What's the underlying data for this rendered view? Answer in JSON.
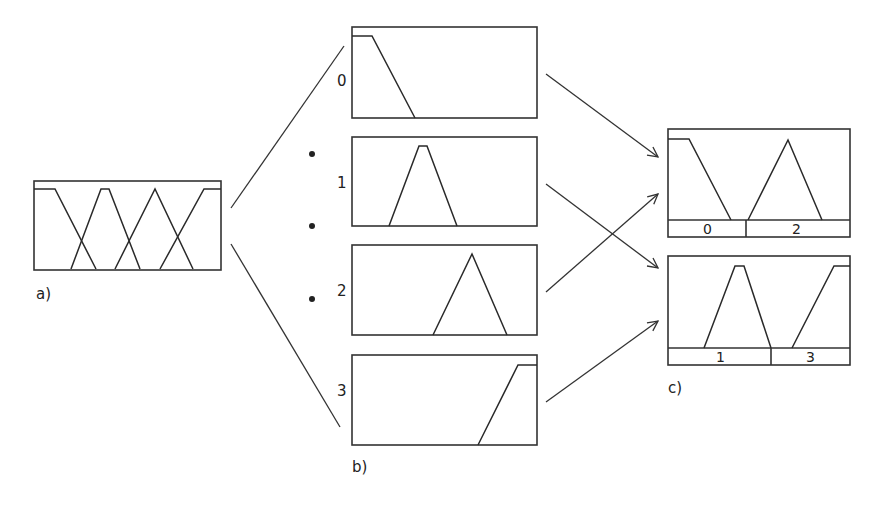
{
  "figure": {
    "panel_a": {
      "label": "a)"
    },
    "panel_b": {
      "label": "b)",
      "subpanels": [
        {
          "index_label": "0"
        },
        {
          "index_label": "1"
        },
        {
          "index_label": "2"
        },
        {
          "index_label": "3"
        }
      ]
    },
    "panel_c": {
      "label": "c)",
      "top": {
        "segments": [
          "0",
          "2"
        ]
      },
      "bottom": {
        "segments": [
          "1",
          "3"
        ]
      }
    },
    "colors": {
      "line": "#333333",
      "background": "#ffffff"
    }
  }
}
